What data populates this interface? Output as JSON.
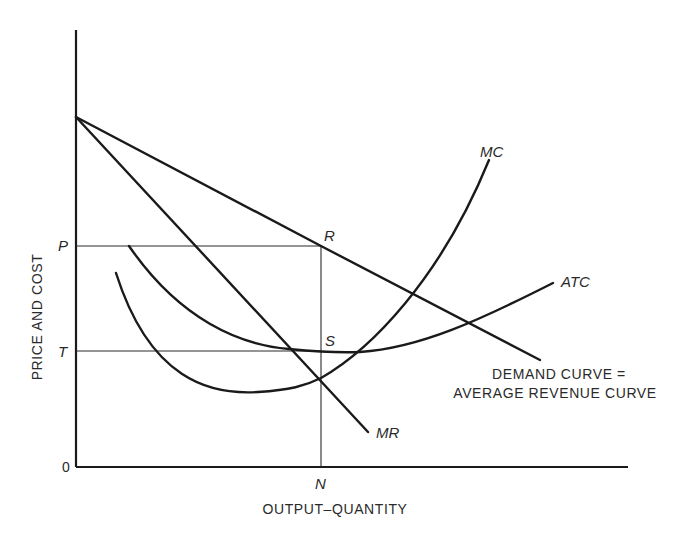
{
  "diagram": {
    "type": "monopoly-price-output",
    "axes": {
      "ylabel": "PRICE AND COST",
      "xlabel": "OUTPUT–QUANTITY",
      "origin_label": "0"
    },
    "y_markers": {
      "price": "P",
      "cost": "T"
    },
    "x_markers": {
      "quantity": "N"
    },
    "points": {
      "revenue_point": "R",
      "cost_point": "S"
    },
    "curves": {
      "mc": "MC",
      "atc": "ATC",
      "mr": "MR",
      "demand_line1": "DEMAND CURVE =",
      "demand_line2": "AVERAGE REVENUE CURVE"
    }
  }
}
